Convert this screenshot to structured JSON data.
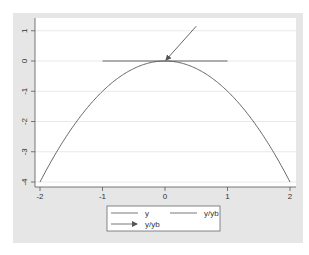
{
  "chart_data": {
    "type": "line",
    "title": "",
    "xlabel": "",
    "ylabel": "",
    "xlim": [
      -2,
      2
    ],
    "ylim": [
      -4,
      1.2
    ],
    "xticks": [
      -2,
      -1,
      0,
      1,
      2
    ],
    "xtick_labels": [
      "-2",
      "-1",
      "0",
      "1",
      "2"
    ],
    "yticks": [
      1,
      0,
      -1,
      -2,
      -3,
      -4
    ],
    "ytick_labels": [
      "1",
      "0",
      "-1",
      "-2",
      "-3",
      "-4"
    ],
    "grid": true,
    "legend_position": "bottom",
    "series": [
      {
        "name": "y",
        "type": "line",
        "function": "y = -x^2",
        "x": [
          -2,
          -1.5,
          -1,
          -0.5,
          0,
          0.5,
          1,
          1.5,
          2
        ],
        "values": [
          -4,
          -2.25,
          -1,
          -0.25,
          0,
          -0.25,
          -1,
          -2.25,
          -4
        ]
      },
      {
        "name": "y/yb",
        "type": "line",
        "description": "horizontal tangent at apex",
        "x": [
          -1,
          1
        ],
        "values": [
          0,
          0
        ]
      },
      {
        "name": "y/yb",
        "type": "arrow",
        "description": "arrow pointing to apex",
        "x": [
          0.5,
          0
        ],
        "values": [
          1.15,
          0
        ]
      }
    ],
    "legend": [
      {
        "label": "y",
        "style": "line"
      },
      {
        "label": "y/yb",
        "style": "line"
      },
      {
        "label": "y/yb",
        "style": "arrow"
      }
    ]
  },
  "colors": {
    "outer_background": "#e6e6e6",
    "plot_background": "#ffffff",
    "gridline": "#e3e3e3",
    "line": "#555555",
    "axis": "#555555"
  }
}
